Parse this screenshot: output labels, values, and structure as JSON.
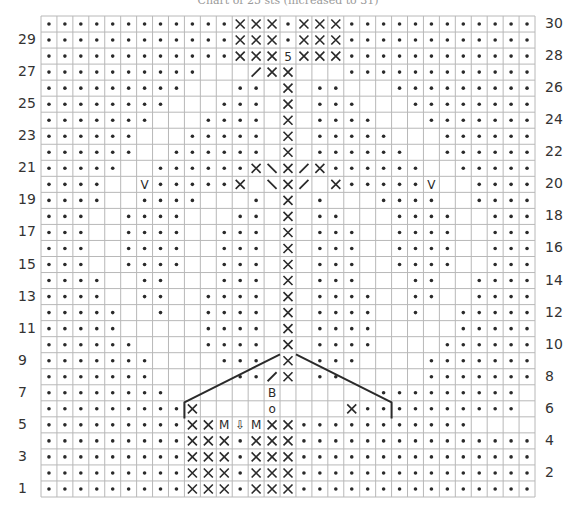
{
  "title": "Chart of 25 sts (increased to 31)",
  "chart": {
    "columns": 31,
    "rows": 30,
    "grid_color": "#b8b8b8",
    "ink_color": "#2a2a2a",
    "left_labels": [
      "29",
      "27",
      "25",
      "23",
      "21",
      "19",
      "17",
      "15",
      "13",
      "11",
      "9",
      "7",
      "5",
      "3",
      "1"
    ],
    "right_labels": [
      "30",
      "28",
      "26",
      "24",
      "22",
      "20",
      "18",
      "16",
      "14",
      "12",
      "10",
      "8",
      "6",
      "4",
      "2"
    ],
    "legend": {
      ".": "purl (dot)",
      "x": "twisted/cross stitch (X)",
      "v": "V stitch",
      "/": "right slant",
      "\\": "left slant",
      "M": "make one (M)",
      "w": "central double increase (V with arrow)",
      "B": "bobble (B)",
      "o": "yarn over (o)",
      "5": "5-st bobble/decrease (5 with caret)",
      " ": "knit (blank)"
    },
    "grid": [
      "............xxx.xxx............",
      "............xxx.xxx............",
      "............xxx5xxx............",
      "..........   /xx   ............",
      ".........   .. x ..   .........",
      "........   ... x ...   ........",
      ".......   .... x ....   .......",
      "......   ..... x .....   ......",
      "......  ...... x ......  ......",
      ".....  ......x\\x/x......  .....",
      "....  v.....x \\x/ x.....v  ....",
      "....  ....   . x .   ....  ....",
      "...  ....   .. x ..   ....  ...",
      "...  ....  ... x ...  ....  ...",
      "...  ....  ... x ...  ....  ...",
      "...  ....  ... x ...  ....  ...",
      "....  ..   ... x ...   ..  ....",
      "....  ..  .... x ....  ..  ....",
      ".....  .  .... x ....  .  .....",
      ".....     .... x ....     .....",
      "......    .... x ....    ......",
      ".......    ... x ...    .......",
      ".......     ../x ..     .......",
      "........      B      .........",
      ".........x    o    x..........",
      ".........xxMwMxx...........",
      ".........xxx.xxx...............",
      ".........xxx.xxx...............",
      ".........xxx.xxx...............",
      ".........xxx.xxx..............."
    ],
    "cable_lines": [
      [
        [
          9,
          4.9
        ],
        [
          9,
          5.9
        ],
        [
          13,
          7.9
        ],
        [
          15,
          8.9
        ]
      ],
      [
        [
          22,
          4.9
        ],
        [
          22,
          5.9
        ],
        [
          18,
          7.9
        ],
        [
          16,
          8.9
        ]
      ]
    ]
  }
}
